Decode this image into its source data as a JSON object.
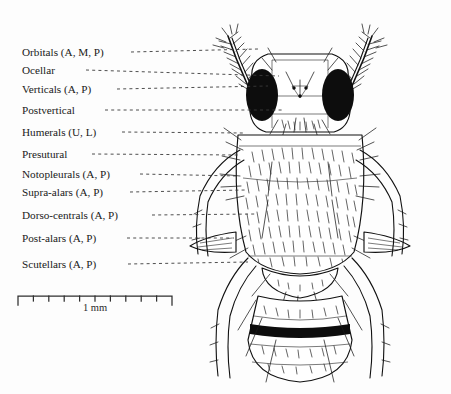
{
  "figure": {
    "background_color": "#fdfdfd",
    "ink_color": "#111111",
    "leader_color": "#3a3a3a"
  },
  "labels": [
    {
      "id": "orbitals",
      "text": "Orbitals (A, M, P)",
      "x": 22,
      "y": 56,
      "leader_start": 131,
      "leader_end": 258,
      "leader_end_y": 49
    },
    {
      "id": "ocellar",
      "text": "Ocellar",
      "x": 22,
      "y": 74,
      "leader_start": 86,
      "leader_end": 279,
      "leader_end_y": 76
    },
    {
      "id": "verticals",
      "text": "Verticals (A, P)",
      "x": 22,
      "y": 93,
      "leader_start": 117,
      "leader_end": 268,
      "leader_end_y": 86
    },
    {
      "id": "postvertical",
      "text": "Postvertical",
      "x": 22,
      "y": 114,
      "leader_start": 105,
      "leader_end": 282,
      "leader_end_y": 110
    },
    {
      "id": "humerals",
      "text": "Humerals (U, L)",
      "x": 22,
      "y": 136,
      "leader_start": 122,
      "leader_end": 243,
      "leader_end_y": 133
    },
    {
      "id": "presutural",
      "text": "Presutural",
      "x": 22,
      "y": 158,
      "leader_start": 92,
      "leader_end": 238,
      "leader_end_y": 155
    },
    {
      "id": "notopleurals",
      "text": "Notopleurals (A, P)",
      "x": 22,
      "y": 178,
      "leader_start": 140,
      "leader_end": 238,
      "leader_end_y": 176
    },
    {
      "id": "supra-alars",
      "text": "Supra-alars (A, P)",
      "x": 22,
      "y": 196,
      "leader_start": 130,
      "leader_end": 246,
      "leader_end_y": 190
    },
    {
      "id": "dorso-centrals",
      "text": "Dorso-centrals (A, P)",
      "x": 22,
      "y": 219,
      "leader_start": 152,
      "leader_end": 256,
      "leader_end_y": 214
    },
    {
      "id": "post-alars",
      "text": "Post-alars (A, P)",
      "x": 22,
      "y": 242,
      "leader_start": 127,
      "leader_end": 234,
      "leader_end_y": 238
    },
    {
      "id": "scutellars",
      "text": "Scutellars (A, P)",
      "x": 22,
      "y": 268,
      "leader_start": 128,
      "leader_end": 248,
      "leader_end_y": 262
    }
  ],
  "scale_bar": {
    "caption": "1 mm",
    "caption_x": 95,
    "caption_y": 311,
    "x_start": 18,
    "x_end": 172,
    "y": 296,
    "cap_height": 9,
    "tick_height": 5,
    "tick_count": 9
  },
  "anatomy": {
    "regions": [
      {
        "name": "head",
        "description": "head with compound eyes"
      },
      {
        "name": "left-compound-eye",
        "description": "solid black left compound eye"
      },
      {
        "name": "right-compound-eye",
        "description": "solid black right compound eye"
      },
      {
        "name": "frons",
        "description": "pale frons between eyes"
      },
      {
        "name": "ocellar-triangle",
        "description": "ocellar triangle with three ocelli"
      },
      {
        "name": "thorax",
        "description": "hairy mesonotum"
      },
      {
        "name": "scutellum",
        "description": "scutellum"
      },
      {
        "name": "abdomen",
        "description": "abdomen with dark transverse band"
      },
      {
        "name": "abdominal-band",
        "description": "solid black transverse abdominal band"
      },
      {
        "name": "left-wing",
        "description": "left wing base"
      },
      {
        "name": "right-wing",
        "description": "right wing base"
      },
      {
        "name": "left-antenna",
        "description": "left antenna with plumose arista"
      },
      {
        "name": "right-antenna",
        "description": "right antenna with plumose arista"
      }
    ]
  }
}
